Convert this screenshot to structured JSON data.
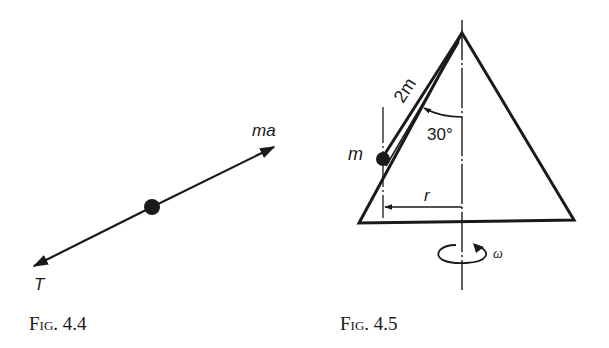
{
  "figures": [
    {
      "id": "fig-4-4",
      "caption_prefix": "Fig.",
      "caption_number": "4.4",
      "labels": {
        "upper_force": "ma",
        "lower_force": "T"
      }
    },
    {
      "id": "fig-4-5",
      "caption_prefix": "Fig.",
      "caption_number": "4.5",
      "labels": {
        "rod_length": "2m",
        "angle": "30°",
        "mass": "m",
        "radius": "r",
        "angular_velocity": "ω"
      }
    }
  ],
  "colors": {
    "ink": "#1a1a1a",
    "background": "#ffffff"
  }
}
